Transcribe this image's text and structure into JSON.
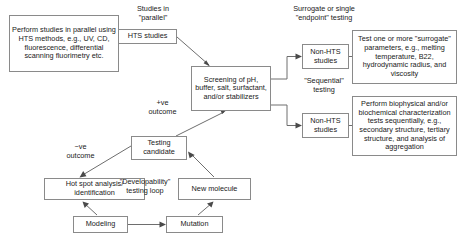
{
  "diagram": {
    "background_color": "#ffffff",
    "box_border_color": "#8a8a8a",
    "edge_color": "#6e6e6e",
    "text_color": "#1a1a1a"
  },
  "nodes": {
    "hts_methods_detail": {
      "label": "Perform studies in parallel using HTS methods, e.g., UV, CD, fluorescence, differential scanning fluorimetry etc.",
      "x": 9,
      "y": 15,
      "w": 110,
      "h": 57
    },
    "hts_studies": {
      "label": "HTS studies",
      "x": 118,
      "y": 29,
      "w": 59,
      "h": 15
    },
    "screening": {
      "label": "Screening of pH, buffer, salt, surfactant, and/or stabilizers",
      "x": 191,
      "y": 66,
      "w": 80,
      "h": 45
    },
    "non_hts_studies_top": {
      "label": "Non-HTS studies",
      "x": 302,
      "y": 44,
      "w": 47,
      "h": 25
    },
    "non_hts_studies_bottom": {
      "label": "Non-HTS studies",
      "x": 302,
      "y": 113,
      "w": 47,
      "h": 25
    },
    "surrogate_detail": {
      "label": "Test one or more \"surrogate\" parameters, e.g., melting temperature, B22, hydrodynamic radius, and viscosity",
      "x": 352,
      "y": 30,
      "w": 105,
      "h": 54
    },
    "biophysical_detail": {
      "label": "Perform biophysical and/or biochemical characterization tests sequentially, e.g., secondary structure, tertiary structure, and analysis of aggregation",
      "x": 352,
      "y": 96,
      "w": 105,
      "h": 60
    },
    "testing_candidate": {
      "label": "Testing candidate",
      "x": 131,
      "y": 136,
      "w": 56,
      "h": 24
    },
    "hot_spot": {
      "label": "Hot spot analysis/ identification",
      "x": 44,
      "y": 178,
      "w": 101,
      "h": 22
    },
    "new_molecule": {
      "label": "New molecule",
      "x": 178,
      "y": 178,
      "w": 73,
      "h": 22
    },
    "modeling": {
      "label": "Modeling",
      "x": 73,
      "y": 216,
      "w": 55,
      "h": 17
    },
    "mutation": {
      "label": "Mutation",
      "x": 166,
      "y": 216,
      "w": 57,
      "h": 17
    }
  },
  "captions": {
    "studies_in_parallel": {
      "label": "Studies in\n\"parallel\"",
      "x": 123,
      "y": 5,
      "w": 60
    },
    "surrogate_endpoint": {
      "label": "Surrogate or single\n\"endpoint\" testing",
      "x": 279,
      "y": 5,
      "w": 90
    },
    "sequential_testing": {
      "label": "\"Sequential\"\ntesting",
      "x": 289,
      "y": 77,
      "w": 70
    },
    "positive_outcome": {
      "label": "+ve\noutcome",
      "x": 140,
      "y": 99,
      "w": 45
    },
    "negative_outcome": {
      "label": "−ve\noutcome",
      "x": 58,
      "y": 143,
      "w": 45
    },
    "developability_loop": {
      "label": "\"Developability\"\ntesting loop",
      "x": 113,
      "y": 178,
      "w": 64
    }
  },
  "edges": [
    {
      "name": "hts-methods-to-hts-studies",
      "from": "hts_methods_detail",
      "to": "hts_studies",
      "arrow": false
    },
    {
      "name": "hts-studies-to-screening",
      "from": "hts_studies",
      "to": "screening",
      "arrow": true
    },
    {
      "name": "screening-to-non-hts-top",
      "from": "screening",
      "to": "non_hts_studies_top",
      "arrow": true
    },
    {
      "name": "screening-to-non-hts-bottom",
      "from": "screening",
      "to": "non_hts_studies_bottom",
      "arrow": true
    },
    {
      "name": "non-hts-top-to-surrogate-detail",
      "from": "non_hts_studies_top",
      "to": "surrogate_detail",
      "arrow": false
    },
    {
      "name": "non-hts-bottom-to-biophysical-detail",
      "from": "non_hts_studies_bottom",
      "to": "biophysical_detail",
      "arrow": false
    },
    {
      "name": "testing-candidate-to-screening",
      "from": "testing_candidate",
      "to": "screening",
      "arrow": true,
      "label": "positive_outcome"
    },
    {
      "name": "testing-candidate-to-hot-spot",
      "from": "testing_candidate",
      "to": "hot_spot",
      "arrow": true,
      "label": "negative_outcome"
    },
    {
      "name": "new-molecule-to-testing-candidate",
      "from": "new_molecule",
      "to": "testing_candidate",
      "arrow": true
    },
    {
      "name": "modeling-to-hot-spot",
      "from": "modeling",
      "to": "hot_spot",
      "arrow": true
    },
    {
      "name": "modeling-to-mutation",
      "from": "modeling",
      "to": "mutation",
      "arrow": true
    },
    {
      "name": "mutation-to-new-molecule",
      "from": "mutation",
      "to": "new_molecule",
      "arrow": true
    }
  ]
}
